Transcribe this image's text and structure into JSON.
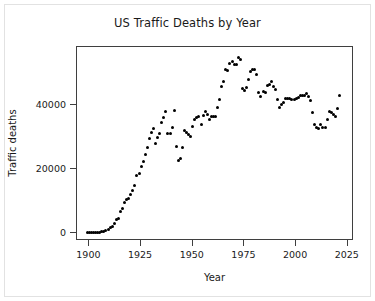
{
  "chart_data": {
    "type": "scatter",
    "title": "US Traffic Deaths by Year",
    "xlabel": "Year",
    "ylabel": "Traffic deaths",
    "grid": false,
    "legend": null,
    "marker": "filled-circle",
    "marker_color": "#000000",
    "xlim": [
      1894,
      2028
    ],
    "ylim": [
      -2500,
      58000
    ],
    "xticks": [
      1900,
      1925,
      1950,
      1975,
      2000,
      2025
    ],
    "xtick_labels": [
      "1900",
      "1925",
      "1950",
      "1975",
      "2000",
      "2025"
    ],
    "yticks": [
      0,
      20000,
      40000
    ],
    "ytick_labels": [
      "0",
      "20000",
      "40000"
    ],
    "x": [
      1899,
      1900,
      1901,
      1902,
      1903,
      1904,
      1905,
      1906,
      1907,
      1908,
      1909,
      1910,
      1911,
      1912,
      1913,
      1914,
      1915,
      1916,
      1917,
      1918,
      1919,
      1920,
      1921,
      1922,
      1923,
      1924,
      1925,
      1926,
      1927,
      1928,
      1929,
      1930,
      1931,
      1932,
      1933,
      1934,
      1935,
      1936,
      1937,
      1938,
      1939,
      1940,
      1941,
      1942,
      1943,
      1944,
      1945,
      1946,
      1947,
      1948,
      1949,
      1950,
      1951,
      1952,
      1953,
      1954,
      1955,
      1956,
      1957,
      1958,
      1959,
      1960,
      1961,
      1962,
      1963,
      1964,
      1965,
      1966,
      1967,
      1968,
      1969,
      1970,
      1971,
      1972,
      1973,
      1974,
      1975,
      1976,
      1977,
      1978,
      1979,
      1980,
      1981,
      1982,
      1983,
      1984,
      1985,
      1986,
      1987,
      1988,
      1989,
      1990,
      1991,
      1992,
      1993,
      1994,
      1995,
      1996,
      1997,
      1998,
      1999,
      2000,
      2001,
      2002,
      2003,
      2004,
      2005,
      2006,
      2007,
      2008,
      2009,
      2010,
      2011,
      2012,
      2013,
      2014,
      2015,
      2016,
      2017,
      2018,
      2019,
      2020,
      2021
    ],
    "y": [
      26,
      36,
      54,
      79,
      117,
      172,
      252,
      338,
      581,
      751,
      1174,
      1599,
      2043,
      2968,
      4079,
      4468,
      6779,
      7766,
      9630,
      10390,
      10896,
      12155,
      13253,
      14859,
      17870,
      18400,
      20771,
      22194,
      24470,
      26557,
      29592,
      31204,
      32500,
      27979,
      29746,
      31029,
      34494,
      36126,
      37819,
      31083,
      30895,
      32914,
      38142,
      27007,
      22727,
      23165,
      26785,
      31874,
      31193,
      30775,
      30246,
      33186,
      35309,
      36088,
      36190,
      33890,
      36688,
      37965,
      36932,
      35331,
      36223,
      36399,
      36285,
      38980,
      41723,
      45645,
      47089,
      50894,
      50724,
      52725,
      53543,
      52627,
      52542,
      54589,
      54052,
      45196,
      44525,
      45523,
      47878,
      50331,
      51093,
      51091,
      49301,
      43945,
      42589,
      44257,
      43825,
      46087,
      46390,
      47087,
      45582,
      44599,
      41508,
      39250,
      40150,
      40716,
      41817,
      42065,
      42013,
      41501,
      41717,
      41945,
      42196,
      43005,
      42884,
      42836,
      43510,
      42708,
      41259,
      37423,
      33883,
      32999,
      32479,
      33782,
      32893,
      32744,
      35484,
      37806,
      37473,
      36835,
      36355,
      38824,
      42915
    ]
  },
  "figure": {
    "background_color": "#ffffff",
    "border_color": "#e2e2e2",
    "axis_color": "#3f3f3f",
    "text_color": "#1a1a1a"
  }
}
